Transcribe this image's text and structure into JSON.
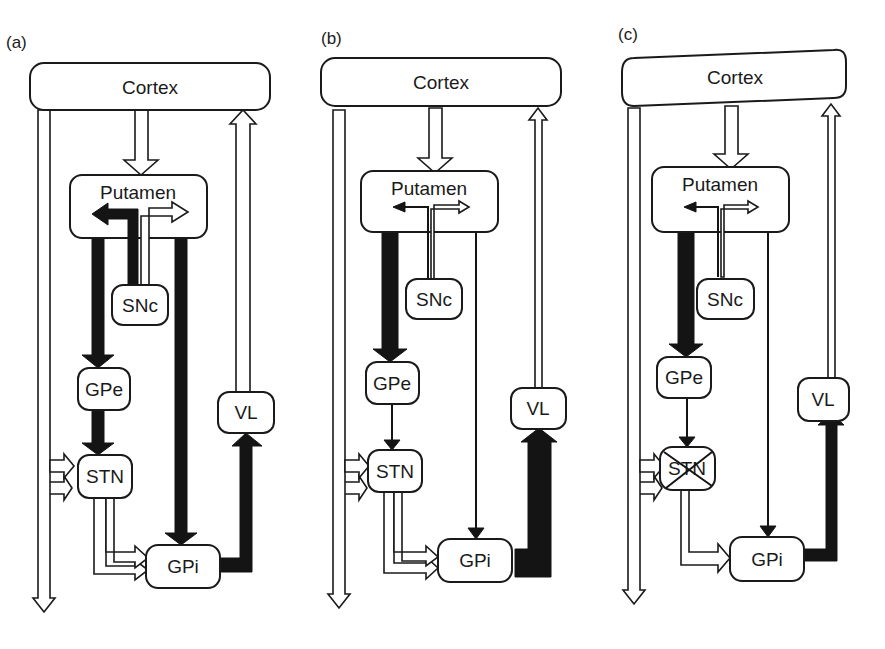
{
  "figure": {
    "panels": [
      {
        "id": "a",
        "label": "(a)",
        "condition": "normal",
        "nodes": {
          "cortex": "Cortex",
          "putamen": "Putamen",
          "snc": "SNc",
          "gpe": "GPe",
          "stn": "STN",
          "gpi": "GPi",
          "vl": "VL"
        },
        "stn_lesioned": false
      },
      {
        "id": "b",
        "label": "(b)",
        "condition": "dopamine-depleted",
        "nodes": {
          "cortex": "Cortex",
          "putamen": "Putamen",
          "snc": "SNc",
          "gpe": "GPe",
          "stn": "STN",
          "gpi": "GPi",
          "vl": "VL"
        },
        "stn_lesioned": false
      },
      {
        "id": "c",
        "label": "(c)",
        "condition": "STN lesion",
        "nodes": {
          "cortex": "Cortex",
          "putamen": "Putamen",
          "snc": "SNc",
          "gpe": "GPe",
          "stn": "STN",
          "gpi": "GPi",
          "vl": "VL"
        },
        "stn_lesioned": true
      }
    ],
    "legend_semantics": {
      "hollow_arrow": "excitatory",
      "solid_arrow": "inhibitory",
      "arrow_width": "relative activity"
    },
    "colors": {
      "ink": "#141414",
      "background": "#ffffff"
    }
  }
}
